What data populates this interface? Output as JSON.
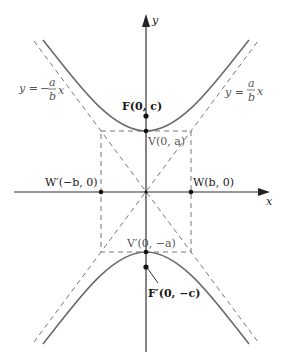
{
  "figure": {
    "axes": {
      "x_label": "x",
      "y_label": "y"
    },
    "points": {
      "focus_top": {
        "label": "F(0, c)",
        "name": "F",
        "coords": "(0, c)"
      },
      "focus_bottom": {
        "label": "F′(0, −c)",
        "name": "F′",
        "coords": "(0, −c)"
      },
      "vertex_top": {
        "label": "V(0, a)",
        "name": "V",
        "coords": "(0, a)"
      },
      "vertex_bottom": {
        "label": "V′(0, −a)",
        "name": "V′",
        "coords": "(0, −a)"
      },
      "covertex_right": {
        "label": "W(b, 0)",
        "name": "W",
        "coords": "(b, 0)"
      },
      "covertex_left": {
        "label": "W′(−b, 0)",
        "name": "W′",
        "coords": "(−b, 0)"
      }
    },
    "asymptotes": {
      "positive": {
        "lhs": "y =",
        "num": "a",
        "den": "b",
        "var": "x",
        "sign": ""
      },
      "negative": {
        "lhs": "y =",
        "num": "a",
        "den": "b",
        "var": "x",
        "sign": "−"
      }
    },
    "colors": {
      "curve": "#6b6b6b",
      "axis": "#333333",
      "dashed": "#777777",
      "point": "#111111"
    }
  }
}
